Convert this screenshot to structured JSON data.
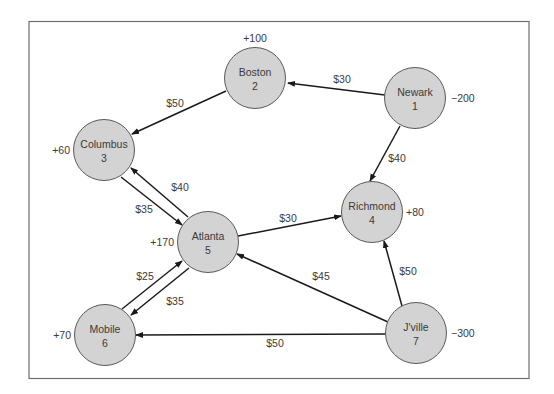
{
  "diagram": {
    "type": "network-flow",
    "colors": {
      "node_fill": "#d3d3d3",
      "node_stroke": "#5a5a5a",
      "edge": "#1a1a1a",
      "text": "#3a3a3a",
      "frame": "#6e6e6e"
    },
    "nodes": [
      {
        "id": "1",
        "name": "Newark",
        "supply": "−200",
        "cx": 415,
        "cy": 98,
        "label_x": 451,
        "label_y": 102,
        "anchor": "start"
      },
      {
        "id": "2",
        "name": "Boston",
        "supply": "+100",
        "cx": 255,
        "cy": 78,
        "label_x": 255,
        "label_y": 42,
        "anchor": "middle"
      },
      {
        "id": "3",
        "name": "Columbus",
        "supply": "+60",
        "cx": 104,
        "cy": 150,
        "label_x": 70,
        "label_y": 154,
        "anchor": "end"
      },
      {
        "id": "4",
        "name": "Richmond",
        "supply": "+80",
        "cx": 372,
        "cy": 212,
        "label_x": 406,
        "label_y": 216,
        "anchor": "start"
      },
      {
        "id": "5",
        "name": "Atlanta",
        "supply": "+170",
        "cx": 208,
        "cy": 242,
        "label_x": 174,
        "label_y": 246,
        "anchor": "end"
      },
      {
        "id": "6",
        "name": "Mobile",
        "supply": "+70",
        "cx": 105,
        "cy": 335,
        "label_x": 71,
        "label_y": 339,
        "anchor": "end"
      },
      {
        "id": "7",
        "name": "J'ville",
        "supply": "−300",
        "cx": 416,
        "cy": 333,
        "label_x": 451,
        "label_y": 337,
        "anchor": "start"
      }
    ],
    "edges": [
      {
        "from": "Newark",
        "to": "Boston",
        "cost": "$30",
        "x1": 385,
        "y1": 95,
        "x2": 288,
        "y2": 83,
        "lx": 342,
        "ly": 83
      },
      {
        "from": "Newark",
        "to": "Richmond",
        "cost": "$40",
        "x1": 400,
        "y1": 126,
        "x2": 370,
        "y2": 181,
        "lx": 397,
        "ly": 162
      },
      {
        "from": "Boston",
        "to": "Columbus",
        "cost": "$50",
        "x1": 226,
        "y1": 91,
        "x2": 132,
        "y2": 134,
        "lx": 175,
        "ly": 107
      },
      {
        "from": "Columbus",
        "to": "Atlanta",
        "cost": "$35",
        "x1": 121,
        "y1": 177,
        "x2": 182,
        "y2": 225,
        "lx": 144,
        "ly": 213
      },
      {
        "from": "Atlanta",
        "to": "Columbus",
        "cost": "$40",
        "x1": 188,
        "y1": 217,
        "x2": 131,
        "y2": 168,
        "lx": 180,
        "ly": 191
      },
      {
        "from": "Atlanta",
        "to": "Richmond",
        "cost": "$30",
        "x1": 238,
        "y1": 236,
        "x2": 341,
        "y2": 216,
        "lx": 288,
        "ly": 222
      },
      {
        "from": "Mobile",
        "to": "Atlanta",
        "cost": "$25",
        "x1": 122,
        "y1": 309,
        "x2": 182,
        "y2": 261,
        "lx": 145,
        "ly": 280
      },
      {
        "from": "Atlanta",
        "to": "Mobile",
        "cost": "$35",
        "x1": 189,
        "y1": 268,
        "x2": 131,
        "y2": 315,
        "lx": 175,
        "ly": 305
      },
      {
        "from": "J'ville",
        "to": "Atlanta",
        "cost": "$45",
        "x1": 388,
        "y1": 322,
        "x2": 237,
        "y2": 254,
        "lx": 321,
        "ly": 280
      },
      {
        "from": "J'ville",
        "to": "Richmond",
        "cost": "$50",
        "x1": 402,
        "y1": 306,
        "x2": 384,
        "y2": 241,
        "lx": 408,
        "ly": 275
      },
      {
        "from": "J'ville",
        "to": "Mobile",
        "cost": "$50",
        "x1": 386,
        "y1": 334,
        "x2": 136,
        "y2": 335,
        "lx": 275,
        "ly": 347
      }
    ]
  }
}
